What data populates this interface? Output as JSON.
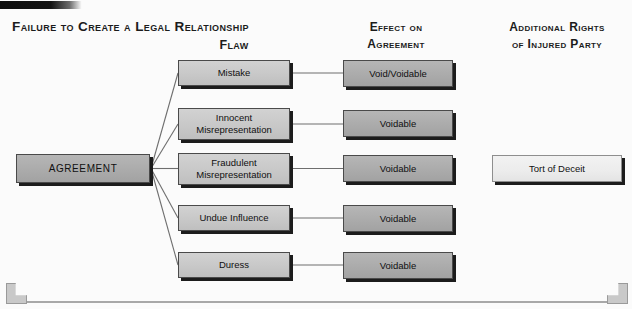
{
  "diagram": {
    "title": "Failure to Create a Legal Relationship",
    "columns": [
      {
        "id": "flaw",
        "label": "Flaw"
      },
      {
        "id": "effect",
        "label_line1": "Effect on",
        "label_line2": "Agreement"
      },
      {
        "id": "rights",
        "label_line1": "Additional Rights",
        "label_line2": "of Injured Party"
      }
    ],
    "root": {
      "label": "AGREEMENT",
      "fill": "#ababab"
    },
    "rows": [
      {
        "flaw": "Mistake",
        "effect": "Void/Voidable",
        "rights": ""
      },
      {
        "flaw": "Innocent\nMisrepresentation",
        "flaw_line1": "Innocent",
        "flaw_line2": "Misrepresentation",
        "effect": "Voidable",
        "rights": ""
      },
      {
        "flaw": "Fraudulent\nMisrepresentation",
        "flaw_line1": "Fraudulent",
        "flaw_line2": "Misrepresentation",
        "effect": "Voidable",
        "rights": "Tort of Deceit"
      },
      {
        "flaw": "Undue Influence",
        "effect": "Voidable",
        "rights": ""
      },
      {
        "flaw": "Duress",
        "effect": "Voidable",
        "rights": ""
      }
    ],
    "colors": {
      "box_dark_fill": "#ababab",
      "box_mid_fill": "#c8c8c8",
      "box_light_fill": "#ececec",
      "box_border": "#4a4a4a",
      "box_shadow": "#1c1c1c",
      "connector_line": "#6e6e6e",
      "background": "#fbfbfb",
      "text": "#101010",
      "accent_bar": "#0d0d0d",
      "frame_rule": "#a8a8a8"
    }
  }
}
